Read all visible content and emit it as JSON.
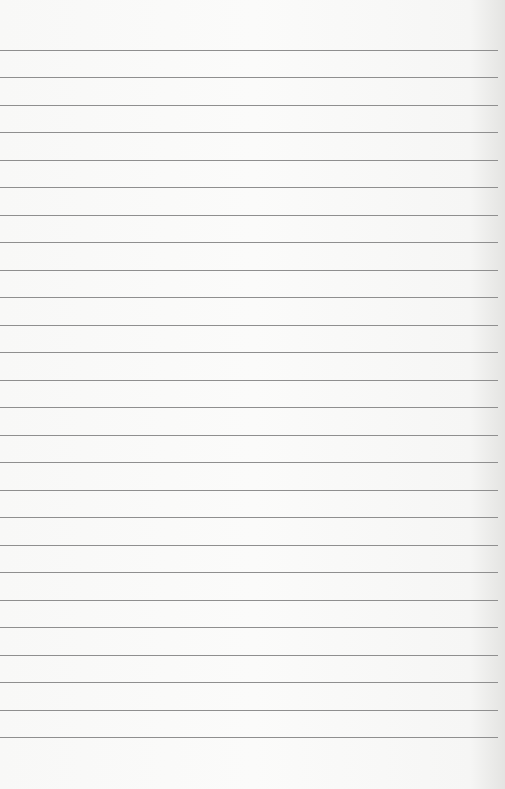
{
  "paper": {
    "type": "lined-notebook-page",
    "line_count": 26,
    "first_line_y": 50,
    "line_spacing": 27.48,
    "line_color": "#8f8f8f",
    "background_color": "#f9f9f8",
    "text": ""
  }
}
